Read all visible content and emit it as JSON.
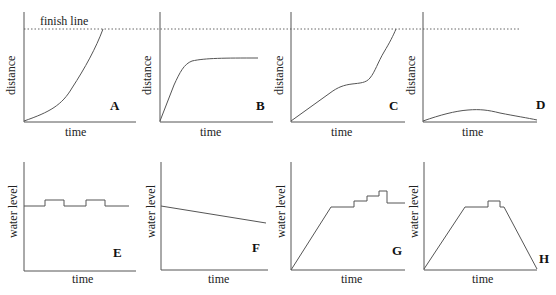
{
  "finish_line_label": "finish line",
  "panels": [
    {
      "id": "A",
      "letter": "A",
      "xlabel": "time",
      "ylabel": "distance"
    },
    {
      "id": "B",
      "letter": "B",
      "xlabel": "time",
      "ylabel": "distance"
    },
    {
      "id": "C",
      "letter": "C",
      "xlabel": "time",
      "ylabel": "distance"
    },
    {
      "id": "D",
      "letter": "D",
      "xlabel": "time",
      "ylabel": "distance"
    },
    {
      "id": "E",
      "letter": "E",
      "xlabel": "time",
      "ylabel": "water level"
    },
    {
      "id": "F",
      "letter": "F",
      "xlabel": "time",
      "ylabel": "water level"
    },
    {
      "id": "G",
      "letter": "G",
      "xlabel": "time",
      "ylabel": "water level"
    },
    {
      "id": "H",
      "letter": "H",
      "xlabel": "time",
      "ylabel": "water level"
    }
  ],
  "colors": {
    "line": "#555555",
    "text": "#222222",
    "background": "#ffffff"
  }
}
